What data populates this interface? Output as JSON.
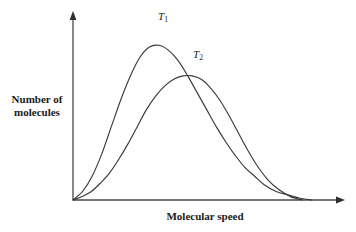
{
  "chart_data": {
    "type": "line",
    "title": "",
    "xlabel": "Molecular speed",
    "ylabel": "Number of\nmolecules",
    "grid": false,
    "legend_position": "inline-annotation",
    "axes": {
      "x_arrow": true,
      "y_arrow": true,
      "x_ticks": [],
      "y_ticks": [],
      "xlim": [
        0,
        1
      ],
      "ylim": [
        0,
        1
      ]
    },
    "annotations": [
      {
        "name": "T1",
        "text": "T",
        "subscript": "1"
      },
      {
        "name": "T2",
        "text": "T",
        "subscript": "2"
      }
    ],
    "series": [
      {
        "name": "T1",
        "label": "T",
        "subscript": "1",
        "description": "Maxwell-Boltzmann distribution at lower temperature: taller, narrower peak",
        "peak_x": 0.34,
        "peak_y": 0.91,
        "x": [
          0.0,
          0.04,
          0.08,
          0.12,
          0.16,
          0.2,
          0.24,
          0.28,
          0.32,
          0.36,
          0.4,
          0.44,
          0.48,
          0.52,
          0.56,
          0.6,
          0.64,
          0.68,
          0.72,
          0.76,
          0.8,
          0.85,
          0.9,
          0.95,
          1.0
        ],
        "y": [
          0.0,
          0.05,
          0.14,
          0.27,
          0.43,
          0.59,
          0.73,
          0.84,
          0.9,
          0.91,
          0.88,
          0.82,
          0.73,
          0.63,
          0.53,
          0.43,
          0.34,
          0.26,
          0.19,
          0.14,
          0.09,
          0.05,
          0.03,
          0.01,
          0.0
        ]
      },
      {
        "name": "T2",
        "label": "T",
        "subscript": "2",
        "description": "Maxwell-Boltzmann distribution at higher temperature: shorter, broader peak shifted right",
        "peak_x": 0.52,
        "peak_y": 0.73,
        "x": [
          0.0,
          0.04,
          0.08,
          0.12,
          0.16,
          0.2,
          0.24,
          0.28,
          0.32,
          0.36,
          0.4,
          0.44,
          0.48,
          0.52,
          0.56,
          0.6,
          0.64,
          0.68,
          0.72,
          0.76,
          0.8,
          0.85,
          0.9,
          0.95,
          1.0
        ],
        "y": [
          0.0,
          0.02,
          0.05,
          0.1,
          0.16,
          0.24,
          0.33,
          0.43,
          0.53,
          0.61,
          0.67,
          0.71,
          0.73,
          0.73,
          0.71,
          0.66,
          0.59,
          0.5,
          0.4,
          0.3,
          0.21,
          0.12,
          0.06,
          0.02,
          0.0
        ]
      }
    ],
    "crossing_point": {
      "x": 0.52,
      "y": 0.73
    },
    "colors": {
      "curve": "#3a3a3a",
      "axis": "#4a4a4a",
      "text": "#1a1a1a",
      "background": "#ffffff"
    }
  }
}
